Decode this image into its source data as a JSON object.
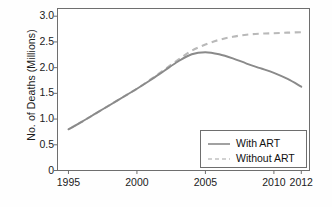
{
  "chart_data": {
    "type": "line",
    "title": "",
    "xlabel": "",
    "ylabel": "No. of Deaths (Millions)",
    "xlim": [
      1994.2,
      2012.6
    ],
    "ylim": [
      0,
      3.15
    ],
    "grid": false,
    "legend_position": "bottom-right",
    "xticks": [
      1995,
      2000,
      2005,
      2010,
      2012
    ],
    "xtick_labels": [
      "1995",
      "2000",
      "2005",
      "2010",
      "2012"
    ],
    "yticks": [
      0,
      0.5,
      1.0,
      1.5,
      2.0,
      2.5,
      3.0
    ],
    "ytick_labels": [
      "0",
      "0.5",
      "1.0",
      "1.5",
      "2.0",
      "2.5",
      "3.0"
    ],
    "series": [
      {
        "name": "With ART",
        "style": "solid",
        "color": "#8a8a8a",
        "x": [
          1995,
          1996,
          1997,
          1998,
          1999,
          2000,
          2001,
          2002,
          2003,
          2004,
          2005,
          2006,
          2007,
          2008,
          2009,
          2010,
          2011,
          2012
        ],
        "values": [
          0.8,
          0.95,
          1.11,
          1.27,
          1.43,
          1.59,
          1.76,
          1.94,
          2.12,
          2.26,
          2.3,
          2.26,
          2.18,
          2.08,
          1.99,
          1.9,
          1.78,
          1.63
        ]
      },
      {
        "name": "Without ART",
        "style": "dashed",
        "color": "#b9b9b9",
        "x": [
          1995,
          1996,
          1997,
          1998,
          1999,
          2000,
          2001,
          2002,
          2003,
          2004,
          2005,
          2006,
          2007,
          2008,
          2009,
          2010,
          2011,
          2012
        ],
        "values": [
          0.8,
          0.95,
          1.11,
          1.27,
          1.43,
          1.59,
          1.77,
          1.96,
          2.15,
          2.33,
          2.45,
          2.54,
          2.6,
          2.64,
          2.66,
          2.67,
          2.68,
          2.69
        ]
      }
    ]
  },
  "legend": {
    "items": [
      {
        "label": "With ART"
      },
      {
        "label": "Without ART"
      }
    ]
  },
  "axes": {
    "y_title": "No. of Deaths (Millions)"
  }
}
